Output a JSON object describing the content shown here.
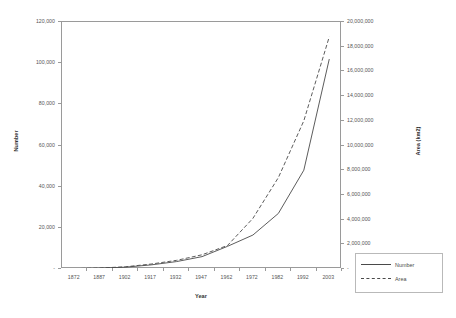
{
  "chart_data": {
    "type": "line",
    "title": "",
    "xlabel": "Year",
    "ylabel": "Number",
    "y2label": "Area (km2)",
    "grid": false,
    "legend_position": "right-bottom",
    "x": [
      1872,
      1887,
      1902,
      1917,
      1932,
      1947,
      1962,
      1972,
      1982,
      1992,
      2003
    ],
    "xticks": [
      "1872",
      "1887",
      "1902",
      "1917",
      "1932",
      "1947",
      "1962",
      "1972",
      "1982",
      "1992",
      "2003"
    ],
    "yticks": [
      "-",
      "20,000",
      "40,000",
      "60,000",
      "80,000",
      "100,000",
      "120,000"
    ],
    "y2ticks": [
      "-",
      "2,000,000",
      "4,000,000",
      "6,000,000",
      "8,000,000",
      "10,000,000",
      "12,000,000",
      "14,000,000",
      "16,000,000",
      "18,000,000",
      "20,000,000"
    ],
    "ylim": [
      0,
      120000
    ],
    "y2lim": [
      0,
      20000000
    ],
    "series": [
      {
        "name": "Number",
        "axis": "left",
        "style": "solid",
        "color": "#4a4a4a",
        "values": [
          200,
          400,
          900,
          2000,
          3600,
          6000,
          11000,
          16500,
          27000,
          48000,
          102000
        ]
      },
      {
        "name": "Area",
        "axis": "right",
        "style": "dashed",
        "color": "#4a4a4a",
        "values": [
          30000,
          80000,
          180000,
          400000,
          700000,
          1150000,
          1900000,
          4100000,
          7400000,
          12000000,
          18800000
        ]
      }
    ],
    "legend": [
      "Number",
      "Area"
    ]
  },
  "axes": {
    "y_left": {
      "title": "Number",
      "ticks": [
        {
          "label": "-",
          "value": 0
        },
        {
          "label": "20,000",
          "value": 20000
        },
        {
          "label": "40,000",
          "value": 40000
        },
        {
          "label": "60,000",
          "value": 60000
        },
        {
          "label": "80,000",
          "value": 80000
        },
        {
          "label": "100,000",
          "value": 100000
        },
        {
          "label": "120,000",
          "value": 120000
        }
      ]
    },
    "y_right": {
      "title": "Area (km2)",
      "ticks": [
        {
          "label": "-",
          "value": 0
        },
        {
          "label": "2,000,000",
          "value": 2000000
        },
        {
          "label": "4,000,000",
          "value": 4000000
        },
        {
          "label": "6,000,000",
          "value": 6000000
        },
        {
          "label": "8,000,000",
          "value": 8000000
        },
        {
          "label": "10,000,000",
          "value": 10000000
        },
        {
          "label": "12,000,000",
          "value": 12000000
        },
        {
          "label": "14,000,000",
          "value": 14000000
        },
        {
          "label": "16,000,000",
          "value": 16000000
        },
        {
          "label": "18,000,000",
          "value": 18000000
        },
        {
          "label": "20,000,000",
          "value": 20000000
        }
      ]
    },
    "x": {
      "title": "Year",
      "ticks": [
        "1872",
        "1887",
        "1902",
        "1917",
        "1932",
        "1947",
        "1962",
        "1972",
        "1982",
        "1992",
        "2003"
      ]
    }
  },
  "legend": {
    "entries": [
      {
        "label": "Number",
        "style": "solid"
      },
      {
        "label": "Area",
        "style": "dashed"
      }
    ]
  }
}
